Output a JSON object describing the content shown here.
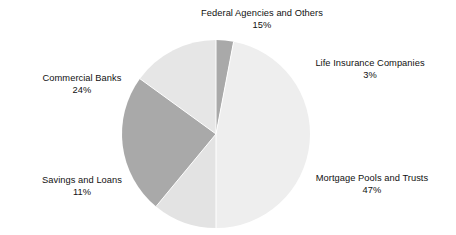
{
  "chart_data": {
    "type": "pie",
    "title": "",
    "subtitle": "",
    "xlabel": "",
    "ylabel": "",
    "grid": false,
    "legend_position": "none",
    "label_format": "name above percent, outside slice",
    "categories": [
      "Mortgage Pools and Trusts",
      "Commercial Banks",
      "Federal Agencies and Others",
      "Savings and Loans",
      "Life Insurance Companies"
    ],
    "values": [
      47,
      24,
      15,
      11,
      3
    ],
    "unit": "%",
    "total": 100,
    "slices": [
      {
        "label": "Federal Agencies and Others",
        "percent_text": "15%",
        "value": 15,
        "color": "#e6e6e6",
        "start_angle_deg": -54.0,
        "end_angle_deg": 0.0
      },
      {
        "label": "Life Insurance Companies",
        "percent_text": "3%",
        "value": 3,
        "color": "#a9a9a9",
        "start_angle_deg": 0.0,
        "end_angle_deg": 10.8
      },
      {
        "label": "Mortgage Pools and Trusts",
        "percent_text": "47%",
        "value": 47,
        "color": "#eeeeee",
        "start_angle_deg": 10.8,
        "end_angle_deg": 180.0
      },
      {
        "label": "Savings and Loans",
        "percent_text": "11%",
        "value": 11,
        "color": "#e3e3e3",
        "start_angle_deg": 180.0,
        "end_angle_deg": 219.6
      },
      {
        "label": "Commercial Banks",
        "percent_text": "24%",
        "value": 24,
        "color": "#a9a9a9",
        "start_angle_deg": 219.6,
        "end_angle_deg": 306.0
      }
    ],
    "geometry": {
      "center_x": 216,
      "center_y": 134,
      "radius": 94,
      "separator_color": "#ffffff"
    },
    "colors": {
      "dark_gray": "#a9a9a9",
      "light_gray": "#eeeeee",
      "mid_light_gray": "#e3e3e3",
      "text": "#111111",
      "background": "#ffffff"
    }
  },
  "labels": {
    "federal": {
      "name": "Federal Agencies and Others",
      "percent": "15%"
    },
    "life": {
      "name": "Life Insurance Companies",
      "percent": "3%"
    },
    "mortgage": {
      "name": "Mortgage Pools and Trusts",
      "percent": "47%"
    },
    "savings": {
      "name": "Savings and Loans",
      "percent": "11%"
    },
    "commercial": {
      "name": "Commercial Banks",
      "percent": "24%"
    }
  }
}
